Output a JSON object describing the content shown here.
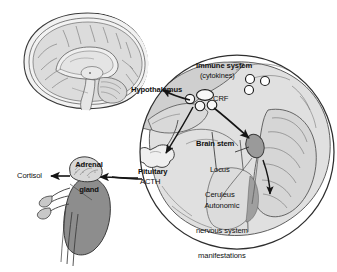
{
  "figure": {
    "labels": {
      "hypothalamus": "Hypothalamus",
      "immune_system": "Immune system",
      "cytokines": "(cytokines)",
      "crf": "CRF",
      "brain_stem": "Brain stem",
      "locus_line1": "Locus",
      "locus_line2": "Ceruleus",
      "autonomic_line1": "Autonomic",
      "autonomic_line2": "nervous system",
      "autonomic_line3": "manifestations",
      "pituitary": "Pituitary",
      "acth": "ACTH",
      "adrenal_line1": "Adrenal",
      "adrenal_line2": "gland",
      "cortisol": "Cortisol"
    },
    "colors": {
      "background": "#ffffff",
      "outline": "#3a3a3a",
      "brain_tissue_light": "#e8e8e8",
      "brain_tissue_mid": "#d2d2d2",
      "brain_tissue_dark": "#bdbdbd",
      "kidney_fill": "#8d8d8d",
      "adrenal_fill": "#d8d8d8",
      "locus_fill": "#9a9a9a",
      "text": "#111111",
      "arrow": "#151515"
    },
    "elements": {
      "inset_brain_caption": "",
      "cytokine_circle_count": 3,
      "crf_vesicle_count": 4
    }
  }
}
